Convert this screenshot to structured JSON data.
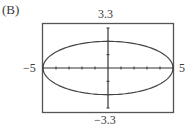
{
  "panel": {
    "label": "(B)"
  },
  "chart_data": {
    "type": "line",
    "title": "",
    "panel_label": "(B)",
    "xlabel": "",
    "ylabel": "",
    "xlim": [
      -5,
      5
    ],
    "ylim": [
      -3.3,
      3.3
    ],
    "window_labels": {
      "xmin": "−5",
      "xmax": "5",
      "ymin": "−3.3",
      "ymax": "3.3"
    },
    "grid": false,
    "x_ticks": [
      -5,
      -4,
      -3,
      -2,
      -1,
      0,
      1,
      2,
      3,
      4,
      5
    ],
    "y_ticks": [
      -3,
      -2,
      -1,
      0,
      1,
      2,
      3
    ],
    "series": [
      {
        "name": "ellipse",
        "equation": "x^2/25 + y^2/4 = 1",
        "semi_major_x": 5,
        "semi_minor_y": 2,
        "center": [
          0,
          0
        ]
      }
    ]
  },
  "colors": {
    "frame": "#555555",
    "curve": "#444444",
    "axis": "#333333",
    "background": "#ffffff"
  }
}
